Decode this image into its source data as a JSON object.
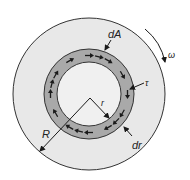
{
  "diagram": {
    "type": "rotating-disk-shear-stress",
    "labels": {
      "dA": "dA",
      "omega": "ω",
      "tau": "τ",
      "r": "r",
      "R": "R",
      "dr": "dr"
    },
    "colors": {
      "background": "#ffffff",
      "outer_disk_fill": "#e8e8e8",
      "ring_fill": "#a9a9a9",
      "inner_disk_fill": "#f0f0f0",
      "stroke": "#333333",
      "arrow": "#1a1a1a"
    },
    "geometry": {
      "outer_disk": {
        "cx": 89,
        "cy": 94,
        "r": 76
      },
      "ring": {
        "cx": 89,
        "cy": 94,
        "r_outer": 45,
        "r_inner": 32
      },
      "center_point": {
        "x": 90,
        "y": 98
      }
    },
    "ring_arrow_direction": "clockwise",
    "rotation_direction": "clockwise"
  }
}
